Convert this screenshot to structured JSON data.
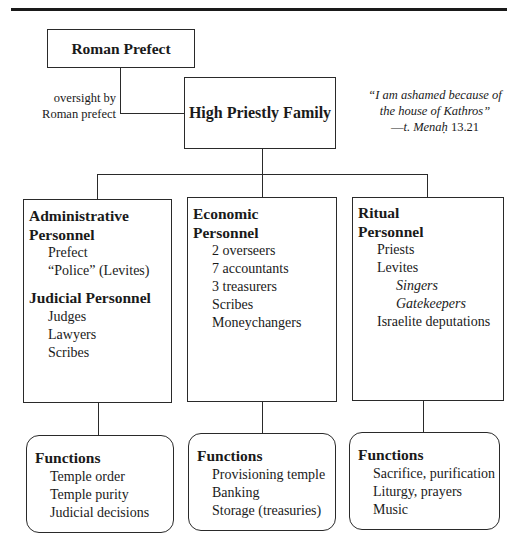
{
  "top_rule": true,
  "roman_prefect": {
    "title": "Roman Prefect"
  },
  "oversight_label": {
    "line1": "oversight by",
    "line2": "Roman prefect"
  },
  "high_priestly_family": {
    "title": "High Priestly Family"
  },
  "quote": {
    "line1": "“I am ashamed because of",
    "line2": "the house of Kathros”",
    "cite_dash": "—",
    "cite_work": "t. Menaḥ",
    "cite_ref": " 13.21"
  },
  "columns": [
    {
      "sections": [
        {
          "heading_line1": "Administrative",
          "heading_line2": "Personnel",
          "items": [
            "Prefect",
            "“Police” (Levites)"
          ]
        },
        {
          "heading_line1": "Judicial Personnel",
          "items": [
            "Judges",
            "Lawyers",
            "Scribes"
          ]
        }
      ],
      "functions": {
        "heading": "Functions",
        "items": [
          "Temple order",
          "Temple purity",
          "Judicial decisions"
        ]
      }
    },
    {
      "sections": [
        {
          "heading_line1": "Economic",
          "heading_line2": "Personnel",
          "items": [
            "2 overseers",
            "7 accountants",
            "3 treasurers",
            "Scribes",
            "Moneychangers"
          ]
        }
      ],
      "functions": {
        "heading": "Functions",
        "items": [
          "Provisioning temple",
          "Banking",
          "Storage (treasuries)"
        ]
      }
    },
    {
      "sections": [
        {
          "heading_line1": "Ritual",
          "heading_line2": "Personnel",
          "items": [
            "Priests",
            "Levites"
          ],
          "sub_items": [
            "Singers",
            "Gatekeepers"
          ],
          "after_items": [
            "Israelite deputations"
          ]
        }
      ],
      "functions": {
        "heading": "Functions",
        "items": [
          "Sacrifice, purification",
          "Liturgy, prayers",
          "Music"
        ]
      }
    }
  ]
}
